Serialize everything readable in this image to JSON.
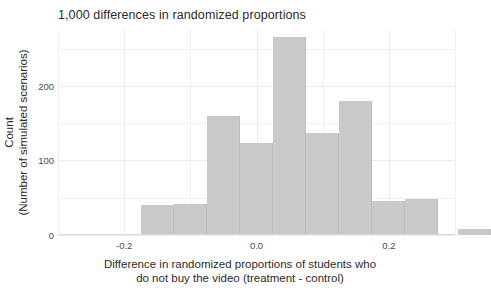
{
  "chart_data": {
    "type": "bar",
    "title": "1,000 differences in randomized proportions",
    "xlabel_line1": "Difference in randomized proportions of students who",
    "xlabel_line2": "do not buy the video (treatment - control)",
    "ylabel_line1": "Count",
    "ylabel_line2": "(Number of simulated scenarios)",
    "xlim": [
      -0.3,
      0.3
    ],
    "ylim": [
      0,
      275
    ],
    "xticks": [
      -0.2,
      0.0,
      0.2
    ],
    "xticklabels": [
      "-0.2",
      "0.0",
      "0.2"
    ],
    "yticks": [
      0,
      100,
      200
    ],
    "yticklabels": [
      "0",
      "100",
      "200"
    ],
    "grid": true,
    "legend": "none",
    "bin_width": 0.05,
    "bin_edges": [
      -0.275,
      -0.225,
      -0.175,
      -0.125,
      -0.075,
      -0.025,
      0.025,
      0.075,
      0.125,
      0.175,
      0.225,
      0.275
    ],
    "bin_centers": [
      -0.25,
      -0.2,
      -0.15,
      -0.1,
      -0.05,
      0.0,
      0.05,
      0.1,
      0.15,
      0.2,
      0.25
    ],
    "categories": [
      "-0.25",
      "-0.20",
      "-0.15",
      "-0.10",
      "-0.05",
      "0.00",
      "0.05",
      "0.10",
      "0.15",
      "0.20",
      "0.25"
    ],
    "values": [
      2,
      2,
      40,
      42,
      160,
      123,
      265,
      137,
      180,
      45,
      48
    ],
    "bars": [
      {
        "center": -0.25,
        "left": -0.275,
        "right": -0.225,
        "count": 2
      },
      {
        "center": -0.2,
        "left": -0.225,
        "right": -0.175,
        "count": 2
      },
      {
        "center": -0.15,
        "left": -0.175,
        "right": -0.125,
        "count": 40
      },
      {
        "center": -0.1,
        "left": -0.125,
        "right": -0.075,
        "count": 42
      },
      {
        "center": -0.05,
        "left": -0.075,
        "right": -0.025,
        "count": 160
      },
      {
        "center": 0.0,
        "left": -0.025,
        "right": 0.025,
        "count": 123
      },
      {
        "center": 0.05,
        "left": 0.025,
        "right": 0.075,
        "count": 265
      },
      {
        "center": 0.1,
        "left": 0.075,
        "right": 0.125,
        "count": 137
      },
      {
        "center": 0.15,
        "left": 0.125,
        "right": 0.175,
        "count": 180
      },
      {
        "center": 0.2,
        "left": 0.175,
        "right": 0.225,
        "count": 45
      },
      {
        "center": 0.25,
        "left": 0.225,
        "right": 0.275,
        "count": 48
      },
      {
        "center": 0.33,
        "left": 0.305,
        "right": 0.355,
        "count": 8
      }
    ],
    "bar_color": "#c9c9c9",
    "bar_edge_color": "#bdbdbd",
    "grid_color": "#ebebeb",
    "axis_color": "#d8d8d8",
    "text_color": "#2b2b2b",
    "tick_text_color": "#4a4a4a",
    "total_simulations": 1000
  }
}
